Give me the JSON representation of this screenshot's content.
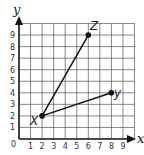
{
  "chart_data": {
    "type": "scatter",
    "title": "",
    "xlabel": "x",
    "ylabel": "y",
    "xlim": [
      0,
      10
    ],
    "ylim": [
      0,
      10
    ],
    "grid": true,
    "x_ticks": [
      "0",
      "1",
      "2",
      "3",
      "4",
      "5",
      "6",
      "7",
      "8",
      "9"
    ],
    "y_ticks": [
      "1",
      "2",
      "3",
      "4",
      "5",
      "6",
      "7",
      "8",
      "9"
    ],
    "points": [
      {
        "label": "X",
        "x": 2,
        "y": 2
      },
      {
        "label": "Z",
        "x": 6,
        "y": 9
      },
      {
        "label": "Y",
        "x": 8,
        "y": 4
      }
    ],
    "segments": [
      {
        "from": "X",
        "to": "Z"
      },
      {
        "from": "X",
        "to": "Y"
      }
    ]
  },
  "labels": {
    "x_axis": "x",
    "y_axis": "y",
    "origin": "0",
    "point_x": "X",
    "point_y": "y",
    "point_z": "Z"
  },
  "colors": {
    "grid": "#555555",
    "axis": "#111111",
    "line": "#111111",
    "point": "#111111"
  }
}
